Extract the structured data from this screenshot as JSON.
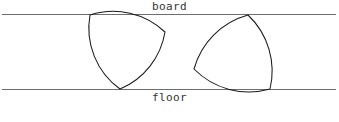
{
  "figure": {
    "background_color": "#ffffff",
    "width": 339,
    "height": 122,
    "labels": {
      "board": "board",
      "floor": "floor",
      "caption": ""
    },
    "colors": {
      "rail_line": "#6e6e6e",
      "shape_outline": "#1a1a1a",
      "label_text": "#333333"
    },
    "rails": [
      {
        "name": "board",
        "y": 14.5,
        "x_start": 2,
        "x_end": 336
      },
      {
        "name": "floor",
        "y": 89.5,
        "x_start": 2,
        "x_end": 336
      }
    ],
    "shapes": [
      {
        "name": "reuleaux-triangle-left",
        "type": "reuleaux-triangle",
        "vertices": [
          {
            "x": 90,
            "y": 15
          },
          {
            "x": 165,
            "y": 32
          },
          {
            "x": 120,
            "y": 89
          }
        ],
        "width": 75,
        "contacts": [
          "board",
          "floor"
        ]
      },
      {
        "name": "reuleaux-triangle-right",
        "type": "reuleaux-triangle",
        "vertices": [
          {
            "x": 248,
            "y": 15
          },
          {
            "x": 270,
            "y": 89
          },
          {
            "x": 194,
            "y": 69
          }
        ],
        "width": 77,
        "contacts": [
          "board",
          "floor"
        ]
      }
    ]
  }
}
